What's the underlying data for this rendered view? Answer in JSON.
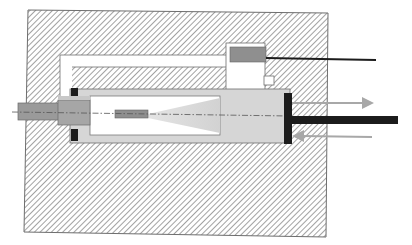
{
  "diagram": {
    "type": "cross-section",
    "labels": [],
    "colors": {
      "background": "#ffffff",
      "hatch_line": "#8a8a8a",
      "housing_outline": "#6e6e6e",
      "chamber_fill": "#d6d6d6",
      "inner_chamber": "#ffffff",
      "cone_fill": "#dcdcdc",
      "component_gray": "#8f8f8f",
      "black_parts": "#1c1c1c",
      "arrow_color": "#a8a8a8",
      "centerline": "#555555"
    },
    "components": [
      {
        "id": "housing-block",
        "kind": "hatched solid"
      },
      {
        "id": "channel",
        "kind": "white L-shaped passage"
      },
      {
        "id": "sensor-housing",
        "kind": "white box with gray sensor element"
      },
      {
        "id": "sensor-wire",
        "kind": "black cable"
      },
      {
        "id": "cylinder-chamber",
        "kind": "light gray chamber"
      },
      {
        "id": "inner-bore",
        "kind": "white bore"
      },
      {
        "id": "cone",
        "kind": "light gray spray/cone shape"
      },
      {
        "id": "small-element",
        "kind": "gray element on centerline"
      },
      {
        "id": "left-sleeve",
        "kind": "gray sleeve / nozzle"
      },
      {
        "id": "seals",
        "kind": "black seal blocks"
      },
      {
        "id": "end-plate",
        "kind": "black piston plate"
      },
      {
        "id": "piston-rod",
        "kind": "black rod"
      },
      {
        "id": "arrow-out",
        "kind": "arrow pointing right"
      },
      {
        "id": "arrow-in",
        "kind": "arrow pointing left"
      },
      {
        "id": "centerline",
        "kind": "dash-dot axis line"
      }
    ]
  }
}
